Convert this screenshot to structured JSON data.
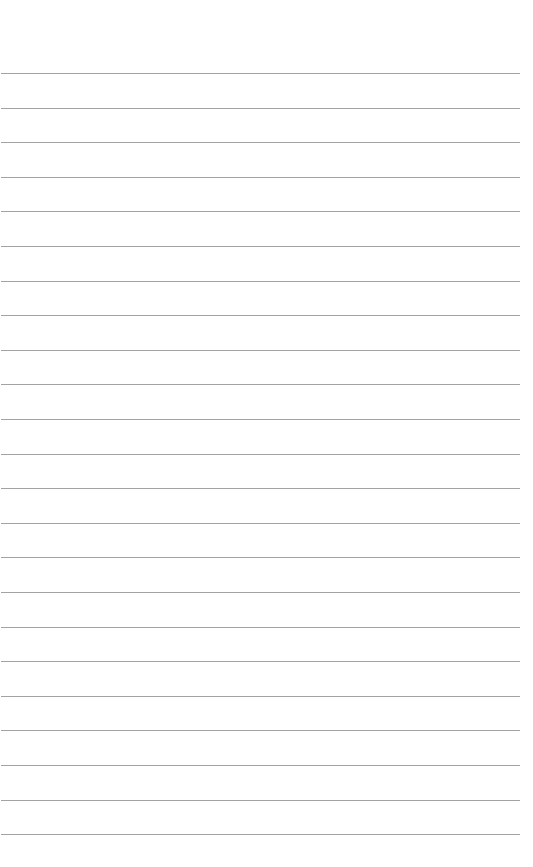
{
  "page": {
    "type": "lined-paper",
    "background_color": "#ffffff",
    "line_color": "#a3a3a3",
    "line_count": 23,
    "first_line_y": 73,
    "line_spacing": 34.6,
    "line_left": 1,
    "line_width": 519
  }
}
